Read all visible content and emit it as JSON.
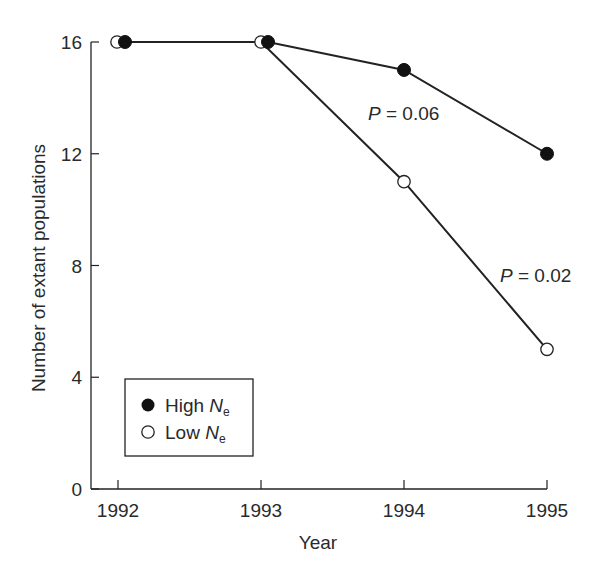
{
  "chart_data": {
    "type": "line",
    "title": "",
    "xlabel": "Year",
    "ylabel": "Number of extant populations",
    "x": [
      1992,
      1993,
      1994,
      1995
    ],
    "xticks": [
      "1992",
      "1993",
      "1994",
      "1995"
    ],
    "yticks": [
      "0",
      "4",
      "8",
      "12",
      "16"
    ],
    "ylim": [
      0,
      16
    ],
    "grid": false,
    "legend_position": "lower-left",
    "series": [
      {
        "name": "High Ne",
        "marker": "filled-circle",
        "values": [
          16,
          16,
          15,
          12
        ]
      },
      {
        "name": "Low Ne",
        "marker": "open-circle",
        "values": [
          16,
          16,
          11,
          5
        ]
      }
    ],
    "annotations": [
      {
        "text_italic": "P",
        "text_rest": " = 0.06",
        "near": "High Ne 1994-1995 segment"
      },
      {
        "text_italic": "P",
        "text_rest": " = 0.02",
        "near": "Low Ne 1994-1995 segment"
      }
    ],
    "legend": [
      {
        "label_main": "High ",
        "label_italic": "N",
        "label_sub": "e",
        "marker": "filled"
      },
      {
        "label_main": "Low ",
        "label_italic": "N",
        "label_sub": "e",
        "marker": "open"
      }
    ]
  }
}
